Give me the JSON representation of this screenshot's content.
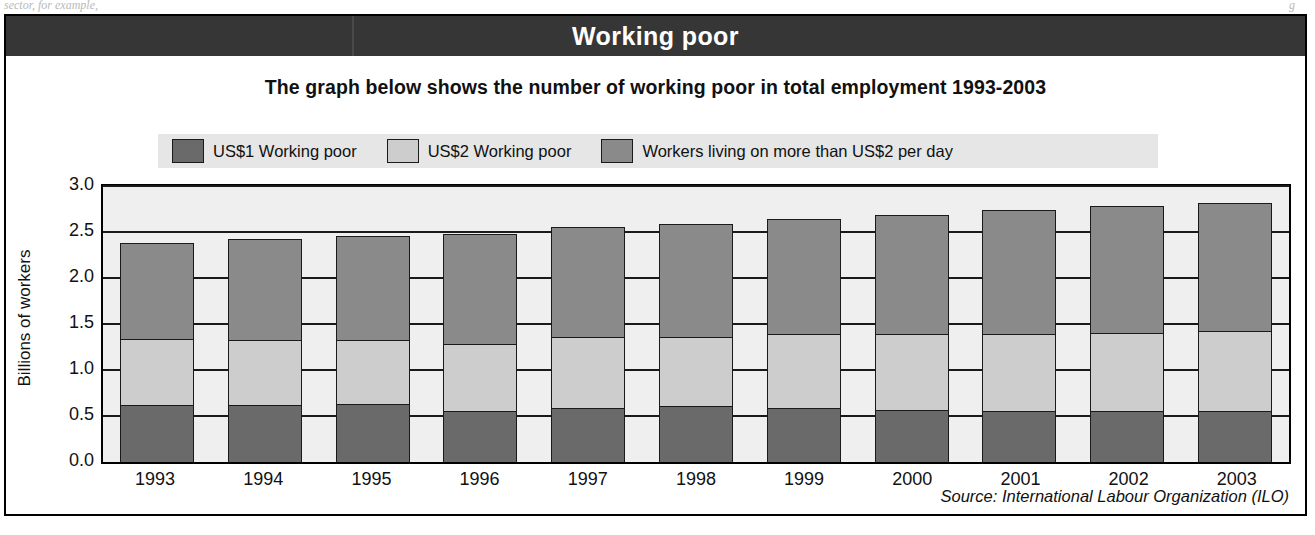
{
  "scan": {
    "bleed_left": "sector, for example,",
    "bleed_right": "g"
  },
  "header": {
    "title": "Working poor"
  },
  "subtitle": "The graph below shows the number of working poor in total employment 1993-2003",
  "source": "Source: International Labour Organization (ILO)",
  "colors": {
    "banner": "#363636",
    "plot_background": "#efefef",
    "legend_background": "#e6e6e6",
    "series_us1": "#6a6a6a",
    "series_us2": "#cdcdcd",
    "series_above_us2": "#8a8a8a",
    "axis": "#1a1a1a"
  },
  "chart_data": {
    "type": "bar",
    "stacked": true,
    "title": "Working poor",
    "subtitle": "The graph below shows the number of working poor in total employment 1993-2003",
    "xlabel": "",
    "ylabel": "Billions of workers",
    "ylim": [
      0.0,
      3.0
    ],
    "yticks": [
      "0.0",
      "0.5",
      "1.0",
      "1.5",
      "2.0",
      "2.5",
      "3.0"
    ],
    "ytick_values": [
      0.0,
      0.5,
      1.0,
      1.5,
      2.0,
      2.5,
      3.0
    ],
    "grid": true,
    "legend_position": "top",
    "categories": [
      "1993",
      "1994",
      "1995",
      "1996",
      "1997",
      "1998",
      "1999",
      "2000",
      "2001",
      "2002",
      "2003"
    ],
    "series": [
      {
        "name": "US$1 Working poor",
        "color": "#6a6a6a",
        "values": [
          0.62,
          0.62,
          0.63,
          0.55,
          0.59,
          0.61,
          0.59,
          0.56,
          0.55,
          0.55,
          0.55
        ]
      },
      {
        "name": "US$2 Working poor",
        "color": "#cdcdcd",
        "values": [
          0.72,
          0.71,
          0.7,
          0.73,
          0.77,
          0.75,
          0.8,
          0.83,
          0.84,
          0.85,
          0.87
        ]
      },
      {
        "name": "Workers living on more than US$2 per day",
        "color": "#8a8a8a",
        "values": [
          1.04,
          1.09,
          1.13,
          1.2,
          1.19,
          1.23,
          1.25,
          1.3,
          1.35,
          1.38,
          1.4
        ]
      }
    ],
    "totals": [
      2.38,
      2.42,
      2.46,
      2.48,
      2.55,
      2.59,
      2.64,
      2.69,
      2.74,
      2.78,
      2.82
    ]
  },
  "legend": {
    "items": [
      {
        "label": "US$1 Working poor",
        "color": "#6a6a6a"
      },
      {
        "label": "US$2 Working poor",
        "color": "#cdcdcd"
      },
      {
        "label": "Workers living on more than US$2 per day",
        "color": "#8a8a8a"
      }
    ]
  }
}
